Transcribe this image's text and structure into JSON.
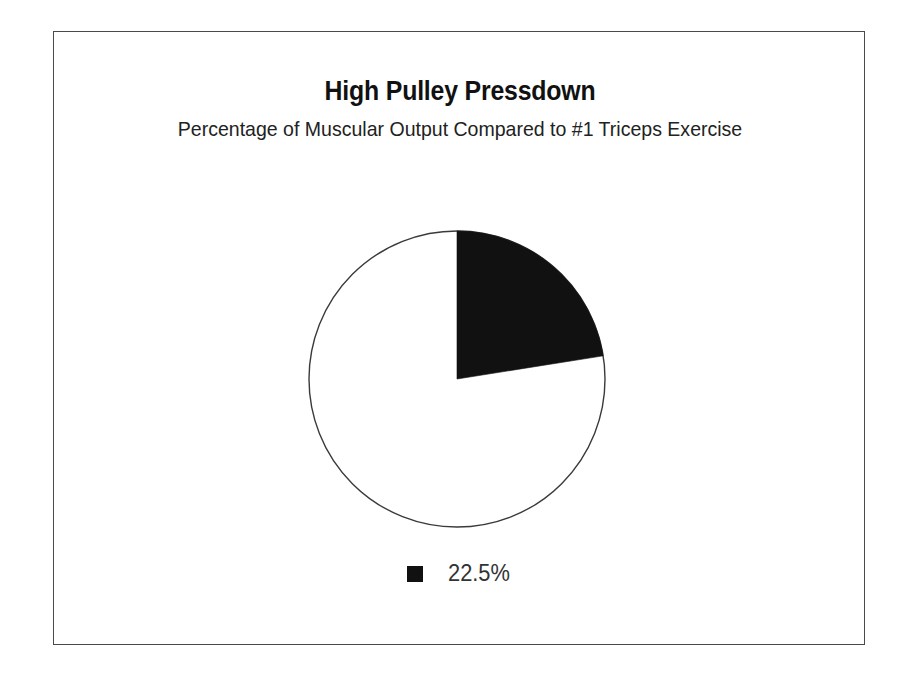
{
  "figure": {
    "background_color": "#ffffff",
    "border_color": "#4a4a4a"
  },
  "chart_data": {
    "type": "pie",
    "title": "High Pulley Pressdown",
    "subtitle": "Percentage of Muscular Output Compared to #1 Triceps Exercise",
    "categories": [
      "22.5%"
    ],
    "values": [
      22.5
    ],
    "labels": [
      "22.5%"
    ],
    "slice_colors": [
      "#111111"
    ],
    "remainder_color": "#ffffff",
    "outline_color": "#3a3a3a",
    "start_angle_deg": 0,
    "sweep_angle_deg": 81,
    "direction": "clockwise",
    "legend": {
      "position": "bottom",
      "entries": [
        {
          "label": "22.5%",
          "color": "#111111"
        }
      ]
    },
    "xlabel": "",
    "ylabel": "",
    "grid": false
  }
}
